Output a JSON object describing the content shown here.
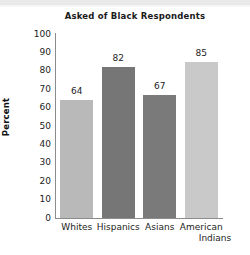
{
  "chart_data": {
    "type": "bar",
    "title": "Asked of Black Respondents",
    "xlabel": "",
    "ylabel": "Percent",
    "categories": [
      "Whites",
      "Hispanics",
      "Asians",
      "American Indians"
    ],
    "category_lines": [
      [
        "Whites"
      ],
      [
        "Hispanics"
      ],
      [
        "Asians"
      ],
      [
        "American",
        "Indians"
      ]
    ],
    "values": [
      64,
      82,
      67,
      85
    ],
    "value_labels": [
      "64",
      "82",
      "67",
      "85"
    ],
    "ylim": [
      0,
      100
    ],
    "yticks": [
      100,
      90,
      80,
      70,
      60,
      50,
      40,
      30,
      20,
      10,
      0
    ],
    "ytick_labels": [
      "100",
      "90",
      "80",
      "70",
      "60",
      "50",
      "40",
      "30",
      "20",
      "10",
      "0"
    ],
    "grid": false,
    "legend": "none",
    "bar_colors": [
      "#b9b9b9",
      "#767676",
      "#7a7a7a",
      "#c9c9c9"
    ],
    "axis_color": "#8c8c8c",
    "background": "#ffffff",
    "text_color": "#1d1d1d"
  }
}
